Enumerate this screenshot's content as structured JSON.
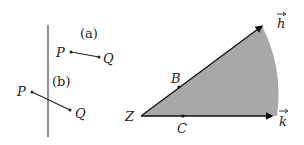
{
  "figure_left": {
    "line_label_a": "(a)",
    "line_label_b": "(b)",
    "segment_a": {
      "start_label": "P",
      "end_label": "Q"
    },
    "segment_b": {
      "start_label": "P",
      "end_label": "Q"
    }
  },
  "figure_right": {
    "vertex_label": "Z",
    "point_on_h": "B",
    "point_on_k": "C",
    "vector_h_label": "h",
    "vector_k_label": "k",
    "fill_color": "#a8a8a8",
    "stroke_color": "#111111"
  }
}
